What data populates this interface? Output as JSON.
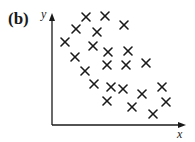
{
  "figure": {
    "panel_label": "(b)",
    "x_axis_label": "x",
    "y_axis_label": "y",
    "marker": "cross",
    "marker_color": "#1a1a1a",
    "axis_color": "#1a1a1a"
  },
  "chart_data": {
    "type": "scatter",
    "title": "(b)",
    "xlabel": "x",
    "ylabel": "y",
    "grid": false,
    "legend": null,
    "points_pixel": [
      [
        86,
        17
      ],
      [
        105,
        16
      ],
      [
        124,
        25
      ],
      [
        76,
        29
      ],
      [
        97,
        32
      ],
      [
        65,
        42
      ],
      [
        93,
        46
      ],
      [
        108,
        52
      ],
      [
        128,
        51
      ],
      [
        75,
        57
      ],
      [
        107,
        65
      ],
      [
        126,
        65
      ],
      [
        146,
        63
      ],
      [
        85,
        71
      ],
      [
        94,
        84
      ],
      [
        111,
        87
      ],
      [
        123,
        89
      ],
      [
        142,
        94
      ],
      [
        162,
        87
      ],
      [
        107,
        101
      ],
      [
        132,
        107
      ],
      [
        166,
        102
      ],
      [
        153,
        114
      ]
    ]
  }
}
